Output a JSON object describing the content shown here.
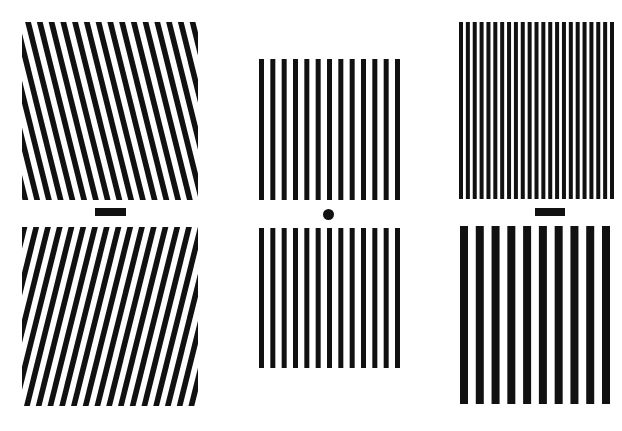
{
  "figure": {
    "colors": {
      "background": "#ffffff",
      "stripe": "#111111"
    },
    "panels": [
      {
        "id": "left-top",
        "type": "tilted-grating",
        "x": 22,
        "y": 22,
        "w": 176,
        "h": 178,
        "period": 11.4,
        "bar": 5.6,
        "tilt_deg": -14
      },
      {
        "id": "left-bottom",
        "type": "tilted-grating",
        "x": 22,
        "y": 227,
        "w": 176,
        "h": 179,
        "period": 11.4,
        "bar": 5.6,
        "tilt_deg": 14
      },
      {
        "id": "middle-top",
        "type": "vertical-grating",
        "x": 259,
        "y": 59,
        "w": 141,
        "h": 141,
        "count": 13,
        "bar": 5
      },
      {
        "id": "middle-bottom",
        "type": "vertical-grating",
        "x": 259,
        "y": 228,
        "w": 141,
        "h": 140,
        "count": 13,
        "bar": 5
      },
      {
        "id": "right-top",
        "type": "vertical-grating",
        "x": 459,
        "y": 22,
        "w": 155,
        "h": 177,
        "count": 23,
        "bar": 4
      },
      {
        "id": "right-bottom",
        "type": "vertical-grating",
        "x": 460,
        "y": 226,
        "w": 150,
        "h": 178,
        "count": 10,
        "bar": 8
      }
    ],
    "fixation_marks": [
      {
        "id": "left-fixation-bar",
        "shape": "bar",
        "x": 95,
        "y": 208,
        "w": 31,
        "h": 8
      },
      {
        "id": "middle-fixation-dot",
        "shape": "dot",
        "cx": 328,
        "cy": 214,
        "d": 11
      },
      {
        "id": "right-fixation-bar",
        "shape": "bar",
        "x": 535,
        "y": 208,
        "w": 30,
        "h": 8
      }
    ]
  }
}
